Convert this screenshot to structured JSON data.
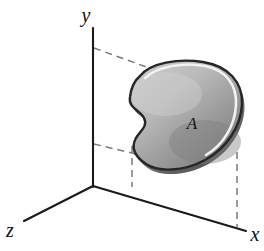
{
  "figure": {
    "background_color": "#ffffff",
    "width": 264,
    "height": 251,
    "axes": {
      "origin": {
        "x": 93,
        "y": 186
      },
      "items": [
        {
          "id": "y-axis",
          "label": "y",
          "label_x": 86,
          "label_y": 22,
          "from": {
            "x": 93,
            "y": 186
          },
          "to": {
            "x": 93,
            "y": 28
          },
          "color": "#1a1a1a"
        },
        {
          "id": "x-axis",
          "label": "x",
          "label_x": 249,
          "label_y": 239,
          "from": {
            "x": 93,
            "y": 186
          },
          "to": {
            "x": 245,
            "y": 231
          },
          "color": "#1a1a1a"
        },
        {
          "id": "z-axis",
          "label": "z",
          "label_x": 8,
          "label_y": 235,
          "from": {
            "x": 93,
            "y": 186
          },
          "to": {
            "x": 24,
            "y": 221
          },
          "color": "#1a1a1a"
        }
      ]
    },
    "region": {
      "label": "A",
      "label_x": 192,
      "label_y": 129,
      "fill_light_color": "#bcbcbc",
      "fill_dark_color": "#7e7e7e",
      "edge_color": "#262626",
      "highlight_color": "#f2f2f2"
    },
    "projection_lines": [
      {
        "id": "top-projection-dash",
        "from": {
          "x": 94,
          "y": 48
        },
        "to": {
          "x": 150,
          "y": 68
        },
        "color": "#7a7a7a"
      },
      {
        "id": "left-projection-dash",
        "from": {
          "x": 94,
          "y": 144
        },
        "to": {
          "x": 155,
          "y": 158
        },
        "color": "#7a7a7a"
      },
      {
        "id": "left-vertical-dash",
        "from": {
          "x": 132,
          "y": 145
        },
        "to": {
          "x": 132,
          "y": 186
        },
        "color": "#7a7a7a"
      },
      {
        "id": "right-vertical-dash",
        "from": {
          "x": 237,
          "y": 152
        },
        "to": {
          "x": 237,
          "y": 227
        },
        "color": "#7a7a7a"
      }
    ]
  }
}
